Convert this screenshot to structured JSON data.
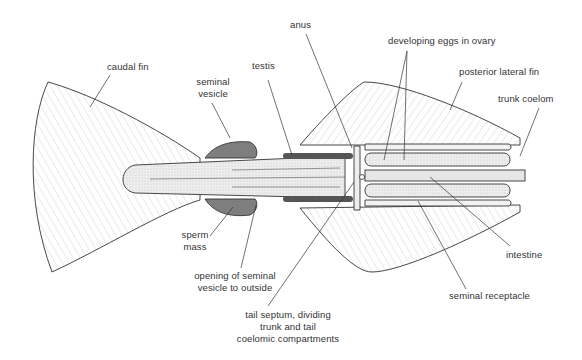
{
  "diagram": {
    "colors": {
      "line": "#333333",
      "fill_stipple": "#c8c8c8",
      "dark_organ": "#555555",
      "background": "#ffffff"
    },
    "labels": {
      "caudal_fin": "caudal fin",
      "seminal_vesicle_1": "seminal",
      "seminal_vesicle_2": "vesicle",
      "testis": "testis",
      "anus": "anus",
      "developing_eggs": "developing eggs in ovary",
      "posterior_lateral_fin": "posterior lateral fin",
      "trunk_coelom": "trunk coelom",
      "sperm_mass_1": "sperm",
      "sperm_mass_2": "mass",
      "opening_1": "opening of seminal",
      "opening_2": "vesicle to outside",
      "intestine": "intestine",
      "seminal_receptacle": "seminal receptacle",
      "tail_septum_1": "tail septum, dividing",
      "tail_septum_2": "trunk and tail",
      "tail_septum_3": "coelomic compartments"
    }
  }
}
